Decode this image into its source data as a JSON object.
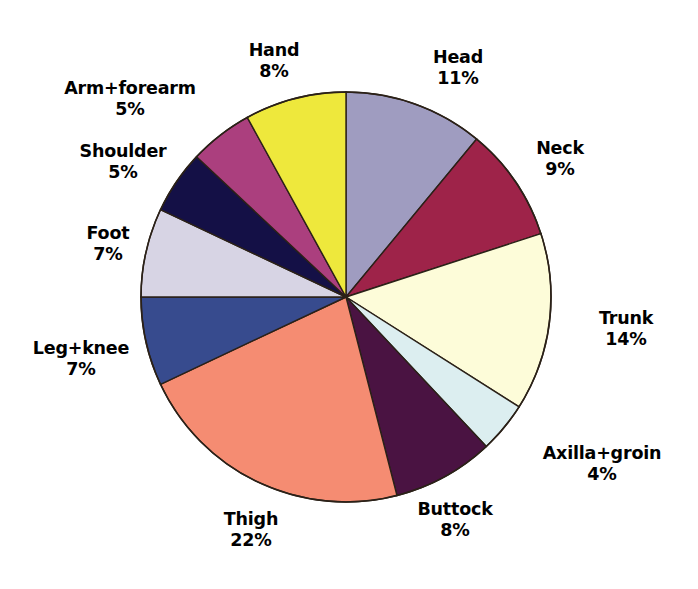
{
  "chart_data": {
    "type": "pie",
    "title": "",
    "subtitle": "",
    "xlabel": "",
    "ylabel": "",
    "legend_position": "outside-labels",
    "grid": false,
    "units": "%",
    "start_angle_deg": 0,
    "direction": "clockwise",
    "center": {
      "x": 346,
      "y": 297
    },
    "radius": 205,
    "categories": [
      "Head",
      "Neck",
      "Trunk",
      "Axilla+groin",
      "Buttock",
      "Thigh",
      "Leg+knee",
      "Foot",
      "Shoulder",
      "Arm+forearm",
      "Hand"
    ],
    "values": [
      11,
      9,
      14,
      4,
      8,
      22,
      7,
      7,
      5,
      5,
      8
    ],
    "colors": [
      "#9f9cc0",
      "#9e2349",
      "#fdfcd9",
      "#dceef0",
      "#4a1342",
      "#f58c72",
      "#374b8e",
      "#d7d4e4",
      "#141046",
      "#ab3f7e",
      "#eee83c"
    ],
    "slice_outline_color": "#2b2118",
    "background_color": "#ffffff",
    "slices": [
      {
        "label": "Head",
        "value": 11,
        "display": "11%",
        "color": "#9f9cc0"
      },
      {
        "label": "Neck",
        "value": 9,
        "display": "9%",
        "color": "#9e2349"
      },
      {
        "label": "Trunk",
        "value": 14,
        "display": "14%",
        "color": "#fdfcd9"
      },
      {
        "label": "Axilla+groin",
        "value": 4,
        "display": "4%",
        "color": "#dceef0"
      },
      {
        "label": "Buttock",
        "value": 8,
        "display": "8%",
        "color": "#4a1342"
      },
      {
        "label": "Thigh",
        "value": 22,
        "display": "22%",
        "color": "#f58c72"
      },
      {
        "label": "Leg+knee",
        "value": 7,
        "display": "7%",
        "color": "#374b8e"
      },
      {
        "label": "Foot",
        "value": 7,
        "display": "7%",
        "color": "#d7d4e4"
      },
      {
        "label": "Shoulder",
        "value": 5,
        "display": "5%",
        "color": "#141046"
      },
      {
        "label": "Arm+forearm",
        "value": 5,
        "display": "5%",
        "color": "#ab3f7e"
      },
      {
        "label": "Hand",
        "value": 8,
        "display": "8%",
        "color": "#eee83c"
      }
    ]
  },
  "labels": {
    "head": {
      "name": "Head",
      "pct": "11%"
    },
    "neck": {
      "name": "Neck",
      "pct": "9%"
    },
    "trunk": {
      "name": "Trunk",
      "pct": "14%"
    },
    "axillagroin": {
      "name": "Axilla+groin",
      "pct": "4%"
    },
    "buttock": {
      "name": "Buttock",
      "pct": "8%"
    },
    "thigh": {
      "name": "Thigh",
      "pct": "22%"
    },
    "legknee": {
      "name": "Leg+knee",
      "pct": "7%"
    },
    "foot": {
      "name": "Foot",
      "pct": "7%"
    },
    "shoulder": {
      "name": "Shoulder",
      "pct": "5%"
    },
    "armforearm": {
      "name": "Arm+forearm",
      "pct": "5%"
    },
    "hand": {
      "name": "Hand",
      "pct": "8%"
    }
  }
}
